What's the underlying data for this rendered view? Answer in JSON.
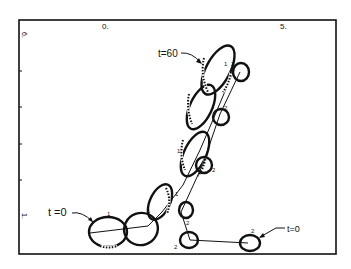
{
  "figure": {
    "axes": {
      "x_ticks": [
        {
          "label": "0."
        },
        {
          "label": "5."
        }
      ],
      "y_ticks": [
        {
          "label": "6."
        },
        {
          "label": "1."
        }
      ]
    },
    "annotations": {
      "left_start": "t =0",
      "left_end": "t=60",
      "right_start": "t=0"
    },
    "cell_markers": {
      "left_series": "1",
      "right_series": "2"
    },
    "colors": {
      "ink": "#111111",
      "background": "#ffffff"
    }
  }
}
